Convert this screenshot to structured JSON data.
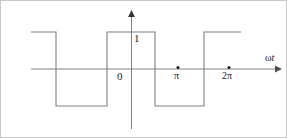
{
  "figure": {
    "width": 287,
    "height": 138,
    "background_color": "#ffffff",
    "border_color": "#c8c8c8",
    "wave_color": "#808080",
    "axis_color": "#808080",
    "text_color": "#1a1a1a"
  },
  "labels": {
    "amplitude_one": "1",
    "origin_zero": "0",
    "tick_pi": "π",
    "tick_two_pi": "2π",
    "x_axis": "ωt",
    "x_axis_omega": "ω",
    "x_axis_t": "t"
  },
  "chart_data": {
    "type": "line",
    "title": "",
    "xlabel": "ωt",
    "ylabel": "",
    "grid": false,
    "legend": null,
    "waveform": "square",
    "amplitude": 1,
    "levels": {
      "high": 1,
      "low": -1
    },
    "xlim": [
      -2.6,
      3.4
    ],
    "ylim": [
      -1.55,
      1.6
    ],
    "xticks": [
      0,
      3.14159,
      6.28318
    ],
    "xtick_labels": [
      "0",
      "π",
      "2π"
    ],
    "yticks": [
      1
    ],
    "ytick_labels": [
      "1"
    ],
    "tick_markers": [
      {
        "label": "π",
        "x": 3.14159,
        "y": 0,
        "marker": "dot"
      },
      {
        "label": "2π",
        "x": 6.28318,
        "y": 0,
        "marker": "dot"
      }
    ],
    "segments": [
      {
        "level": 1,
        "x_start": -2.6,
        "x_end": -1.8
      },
      {
        "level": -1,
        "x_start": -1.8,
        "x_end": -0.16
      },
      {
        "level": 1,
        "x_start": -0.16,
        "x_end": 1.38
      },
      {
        "level": -1,
        "x_start": 1.38,
        "x_end": 2.95
      },
      {
        "level": 1,
        "x_start": 2.95,
        "x_end": 4.13
      }
    ],
    "pixel_geometry": {
      "axis_y_pixel": 68,
      "axis_x_pixel": 130,
      "high_y_pixel": 31,
      "low_y_pixel": 105,
      "x_axis_start_pixel": 30,
      "x_axis_end_pixel": 278,
      "y_axis_top_pixel": 12,
      "y_axis_bottom_pixel": 128,
      "transitions_pixel": [
        30,
        55,
        106,
        154,
        203,
        240
      ],
      "pi_pixel_x": 177,
      "two_pi_pixel_x": 228
    }
  }
}
